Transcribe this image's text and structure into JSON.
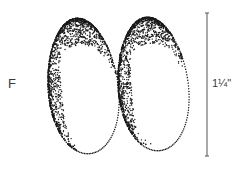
{
  "figure": {
    "panel_label": "F",
    "size_label": "1¼\"",
    "scale_bar": {
      "x": 207,
      "y1": 13,
      "y2": 156,
      "tick": 2,
      "color": "#555555"
    },
    "ink_color": "#1a1a1a",
    "seeds": [
      {
        "name": "left-seed",
        "cx": 83,
        "cy": 86,
        "rx": 35,
        "ry": 68,
        "tilt": -6,
        "shade": "left-top"
      },
      {
        "name": "right-seed",
        "cx": 153,
        "cy": 84,
        "rx": 35,
        "ry": 67,
        "tilt": -6,
        "shade": "left-top"
      }
    ]
  }
}
